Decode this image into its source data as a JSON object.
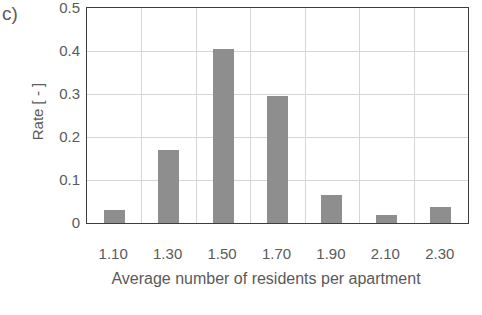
{
  "panel_label": "c)",
  "chart_data": {
    "type": "bar",
    "title": "",
    "subtitle": "",
    "xlabel": "Average number of residents per apartment",
    "ylabel": "Rate [ - ]",
    "categories": [
      "1.10",
      "1.30",
      "1.50",
      "1.70",
      "1.90",
      "2.10",
      "2.30"
    ],
    "values": [
      0.03,
      0.17,
      0.405,
      0.295,
      0.065,
      0.018,
      0.037
    ],
    "ylim": [
      0,
      0.5
    ],
    "y_ticks": [
      "0.5",
      "0.4",
      "0.3",
      "0.2",
      "0.1",
      "0"
    ],
    "y_tick_values": [
      0.5,
      0.4,
      0.3,
      0.2,
      0.1,
      0
    ],
    "grid": "horizontal-and-vertical",
    "legend": "none",
    "bar_color": "#8e8e8e",
    "axis_color": "#3d3d3d",
    "gridline_color": "#d6d6d6",
    "text_color": "#5a5a5a"
  }
}
